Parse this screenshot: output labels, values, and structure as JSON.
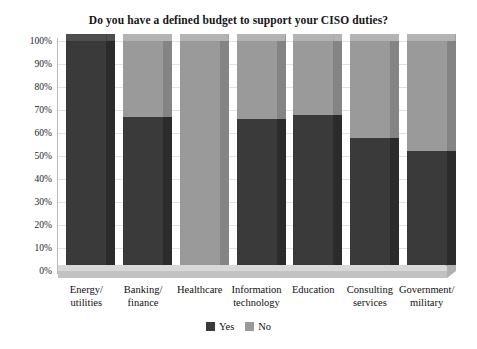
{
  "chart_data": {
    "type": "bar",
    "subtype": "stacked-100-percent-3d",
    "title": "Do you have a defined budget to support your CISO duties?",
    "xlabel": "",
    "ylabel": "",
    "ylim": [
      0,
      100
    ],
    "ytick_labels": [
      "100%",
      "90%",
      "80%",
      "70%",
      "60%",
      "50%",
      "40%",
      "30%",
      "20%",
      "10%",
      "0%"
    ],
    "ytick_values": [
      100,
      90,
      80,
      70,
      60,
      50,
      40,
      30,
      20,
      10,
      0
    ],
    "grid": true,
    "legend_position": "bottom",
    "categories": [
      "Energy/ utilities",
      "Banking/ finance",
      "Healthcare",
      "Information technology",
      "Education",
      "Consulting services",
      "Government/ military"
    ],
    "category_lines": [
      [
        "Energy/",
        "utilities"
      ],
      [
        "Banking/",
        "finance"
      ],
      [
        "Healthcare",
        ""
      ],
      [
        "Information",
        "technology"
      ],
      [
        "Education",
        ""
      ],
      [
        "Consulting",
        "services"
      ],
      [
        "Government/",
        "military"
      ]
    ],
    "series": [
      {
        "name": "Yes",
        "color": "#3a3a3a",
        "values": [
          100,
          67,
          0,
          66,
          68,
          58,
          52
        ]
      },
      {
        "name": "No",
        "color": "#9a9a9a",
        "values": [
          0,
          33,
          100,
          34,
          32,
          42,
          48
        ]
      }
    ]
  },
  "colors": {
    "yes": "#3a3a3a",
    "yes_top": "#4e4e4e",
    "yes_side": "#2b2b2b",
    "no": "#9a9a9a",
    "no_top": "#b3b3b3",
    "no_side": "#848484",
    "grid": "#e2e2e2",
    "axis": "#b9b9b9",
    "floor_top": "#d8d8d8",
    "floor_front": "#c2c2c2",
    "floor_side": "#b0b0b0",
    "text": "#101010",
    "background": "#ffffff"
  }
}
